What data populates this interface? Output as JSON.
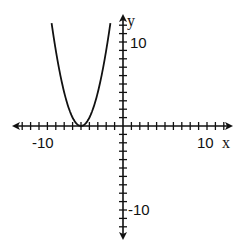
{
  "chart_data": {
    "type": "line",
    "title": "",
    "xlabel": "x",
    "ylabel": "y",
    "xlim": [
      -11,
      11
    ],
    "ylim": [
      -12,
      12
    ],
    "x_tick_labels": [
      "-10",
      "10"
    ],
    "y_tick_labels": [
      "10",
      "-10"
    ],
    "tick_step": 1,
    "grid": false,
    "series": [
      {
        "name": "y = (x + 5)^2",
        "x": [
          -8.5,
          -8,
          -7,
          -6,
          -5,
          -4,
          -3,
          -2,
          -1.5
        ],
        "values": [
          12.25,
          9,
          4,
          1,
          0,
          1,
          4,
          9,
          12.25
        ]
      }
    ],
    "vertex": [
      -5,
      0
    ]
  },
  "axes": {
    "x_label": "x",
    "y_label": "y",
    "x_min_label": "-10",
    "x_max_label": "10",
    "y_max_label": "10",
    "y_min_label": "-10"
  }
}
